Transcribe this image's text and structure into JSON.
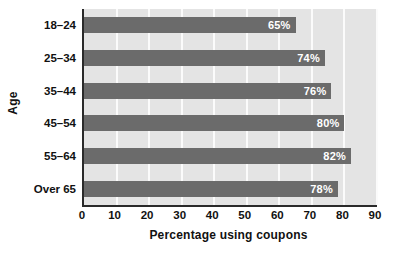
{
  "chart_data": {
    "type": "bar",
    "orientation": "horizontal",
    "title": "",
    "xlabel": "Percentage using coupons",
    "ylabel": "Age",
    "categories": [
      "18–24",
      "25–34",
      "35–44",
      "45–54",
      "55–64",
      "Over 65"
    ],
    "values": [
      65,
      74,
      76,
      80,
      82,
      78
    ],
    "value_labels": [
      "65%",
      "74%",
      "76%",
      "80%",
      "82%",
      "78%"
    ],
    "xlim": [
      0,
      90
    ],
    "xticks": [
      0,
      10,
      20,
      30,
      40,
      50,
      60,
      70,
      80,
      90
    ],
    "xtick_labels": [
      "0",
      "10",
      "20",
      "30",
      "40",
      "50",
      "60",
      "70",
      "80",
      "90"
    ],
    "grid": "vertical",
    "legend": "none",
    "colors": {
      "bar": "#6b6b6b",
      "plot_background": "#e4e4e4",
      "gridline": "#fbfbfb",
      "axis_line": "#2a2a2a",
      "value_label": "#ffffff",
      "text": "#111111",
      "figure_background": "#ffffff"
    }
  }
}
